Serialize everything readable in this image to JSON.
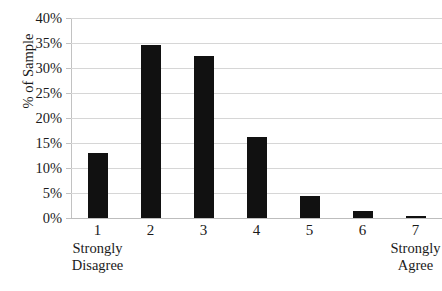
{
  "chart_data": {
    "type": "bar",
    "title": "",
    "subtitle": "",
    "xlabel": "",
    "ylabel": "% of Sample",
    "categories": [
      "1",
      "2",
      "3",
      "4",
      "5",
      "6",
      "7"
    ],
    "values": [
      13.1,
      34.6,
      32.4,
      16.2,
      4.4,
      1.4,
      0.4
    ],
    "value_labels": [
      "13.1%",
      "34.6%",
      "32.4%",
      "16.2%",
      "4.4%",
      "1.4%",
      "0.4%"
    ],
    "ylim": [
      0,
      40
    ],
    "ytick_values": [
      0,
      5,
      10,
      15,
      20,
      25,
      30,
      35,
      40
    ],
    "ytick_labels": [
      "0%",
      "5%",
      "10%",
      "15%",
      "20%",
      "25%",
      "30%",
      "35%",
      "40%"
    ],
    "grid": true,
    "grid_axis": "y",
    "legend": false,
    "legend_position": "none",
    "bar_color": "#111111",
    "gridline_color": "#d6d6d6",
    "axis_color": "#c2c2c2",
    "anchor_labels": [
      {
        "category": "1",
        "text_line1": "Strongly",
        "text_line2": "Disagree"
      },
      {
        "category": "7",
        "text_line1": "Strongly",
        "text_line2": "Agree"
      }
    ]
  },
  "axis": {
    "y_title": "% of Sample"
  }
}
